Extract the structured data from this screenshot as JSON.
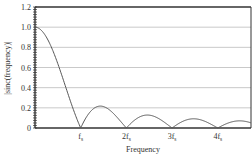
{
  "chart_data": {
    "type": "line",
    "title": "",
    "xlabel": "Frequency",
    "ylabel": "|sinc(frequency)|",
    "ylim": [
      0,
      1.2
    ],
    "xlim_fs": [
      0,
      4.73
    ],
    "y_ticks": [
      "0",
      "0.2",
      "0.4",
      "0.6",
      "0.8",
      "1.0",
      "1.2"
    ],
    "x_ticks": [
      {
        "label": "f",
        "sub": "s",
        "pos": 1
      },
      {
        "label": "2f",
        "sub": "s",
        "pos": 2
      },
      {
        "label": "3f",
        "sub": "s",
        "pos": 3
      },
      {
        "label": "4f",
        "sub": "s",
        "pos": 4
      }
    ],
    "grid": true,
    "series": [
      {
        "name": "|sinc(f/fs)|",
        "function": "abs(sin(pi*x)/(pi*x))",
        "color": "#555555",
        "key_points": [
          [
            0,
            1.0
          ],
          [
            0.5,
            0.64
          ],
          [
            1,
            0
          ],
          [
            1.43,
            0.217
          ],
          [
            2,
            0
          ],
          [
            2.46,
            0.128
          ],
          [
            3,
            0
          ],
          [
            3.47,
            0.091
          ],
          [
            4,
            0
          ],
          [
            4.48,
            0.071
          ]
        ]
      }
    ]
  }
}
